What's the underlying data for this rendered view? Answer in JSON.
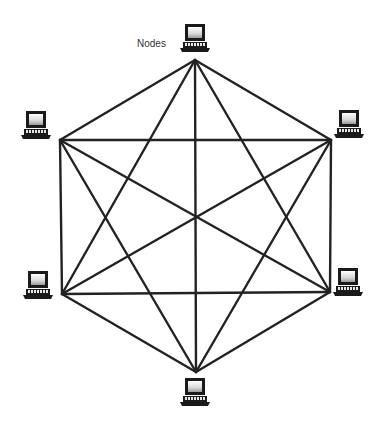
{
  "diagram": {
    "label": "Nodes",
    "label_pos": [
      137,
      38
    ],
    "line_color": "#222222",
    "line_width": 2.4,
    "nodes": [
      {
        "id": "top",
        "vertex": [
          195,
          60
        ],
        "icon": [
          195,
          39
        ]
      },
      {
        "id": "upper-right",
        "vertex": [
          331,
          140
        ],
        "icon": [
          349,
          125
        ]
      },
      {
        "id": "lower-right",
        "vertex": [
          330,
          292
        ],
        "icon": [
          348,
          283
        ]
      },
      {
        "id": "bottom",
        "vertex": [
          196,
          372
        ],
        "icon": [
          195,
          393
        ]
      },
      {
        "id": "lower-left",
        "vertex": [
          62,
          294
        ],
        "icon": [
          38,
          286
        ]
      },
      {
        "id": "upper-left",
        "vertex": [
          60,
          140
        ],
        "icon": [
          36,
          126
        ]
      }
    ]
  }
}
